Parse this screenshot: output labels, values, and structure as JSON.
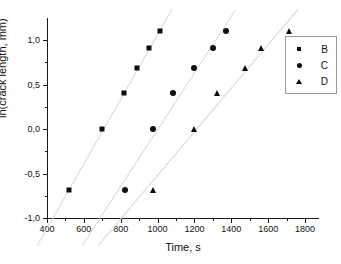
{
  "chart_data": {
    "type": "scatter",
    "title": "",
    "xlabel": "Time, s",
    "ylabel": "ln(crack length, mm)",
    "xlim": [
      400,
      1800
    ],
    "ylim": [
      -1.0,
      1.0
    ],
    "xticks": [
      400,
      600,
      800,
      1000,
      1200,
      1400,
      1600,
      1800
    ],
    "xtick_labels": [
      "400",
      "600",
      "800",
      "1000",
      "1200",
      "1400",
      "1600",
      "1800"
    ],
    "yticks": [
      -1.0,
      -0.5,
      0.0,
      0.5,
      1.0
    ],
    "ytick_labels": [
      "-1,0",
      "-0,5",
      "0,0",
      "0,5",
      "1,0"
    ],
    "decimal_separator": ",",
    "grid": false,
    "legend_position": "right",
    "trendlines_visible": true,
    "trendline_color": "#d8d8d8",
    "marker_color": "#0d0d0d",
    "series": [
      {
        "name": "B",
        "marker": "square",
        "x": [
          520,
          700,
          820,
          890,
          955,
          1015
        ],
        "y": [
          -0.69,
          0.0,
          0.4,
          0.69,
          0.91,
          1.1
        ]
      },
      {
        "name": "C",
        "marker": "circle",
        "x": [
          825,
          975,
          1085,
          1195,
          1300,
          1370
        ],
        "y": [
          -0.69,
          0.0,
          0.4,
          0.69,
          0.91,
          1.1
        ]
      },
      {
        "name": "D",
        "marker": "triangle",
        "x": [
          975,
          1195,
          1320,
          1475,
          1560,
          1715
        ],
        "y": [
          -0.69,
          0.0,
          0.4,
          0.69,
          0.91,
          1.1
        ]
      }
    ]
  },
  "legend": {
    "entries": [
      {
        "label": "B",
        "marker": "square"
      },
      {
        "label": "C",
        "marker": "circle"
      },
      {
        "label": "D",
        "marker": "triangle"
      }
    ]
  }
}
